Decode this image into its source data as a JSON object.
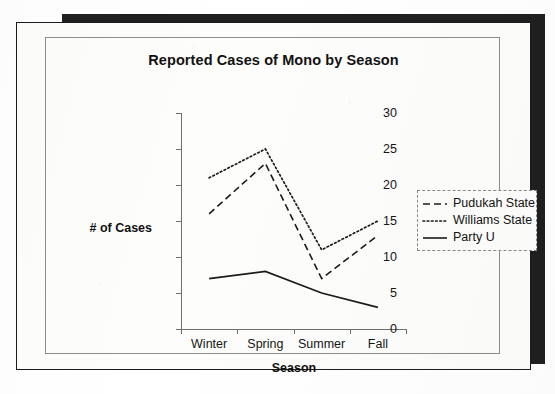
{
  "document": {
    "kind": "scanned-chart-page",
    "page_background": "#fdfdfc",
    "shadow_color": "#201f1f",
    "outer_border_color": "#1b1b1b",
    "inner_border_color": "#8d8d8d"
  },
  "chart_data": {
    "type": "line",
    "title": "Reported Cases of Mono by Season",
    "xlabel": "Season",
    "ylabel": "# of Cases",
    "categories": [
      "Winter",
      "Spring",
      "Summer",
      "Fall"
    ],
    "ylim": [
      0,
      30
    ],
    "ytick_step": 5,
    "ytick_labels": [
      "0",
      "5",
      "10",
      "15",
      "20",
      "25",
      "30"
    ],
    "ytick_values": [
      0,
      5,
      10,
      15,
      20,
      25,
      30
    ],
    "grid": false,
    "legend_position": "right",
    "series": [
      {
        "name": "Pudukah State",
        "values": [
          16,
          23,
          7,
          13
        ],
        "style": "dashed",
        "color": "#1b1b1b",
        "dash_pattern": "7,4"
      },
      {
        "name": "Williams State",
        "values": [
          21,
          25,
          11,
          15
        ],
        "style": "dotted",
        "color": "#1b1b1b",
        "dash_pattern": "1.6,2.6"
      },
      {
        "name": "Party U",
        "values": [
          7,
          8,
          5,
          3
        ],
        "style": "solid",
        "color": "#1b1b1b",
        "dash_pattern": "none"
      }
    ]
  }
}
